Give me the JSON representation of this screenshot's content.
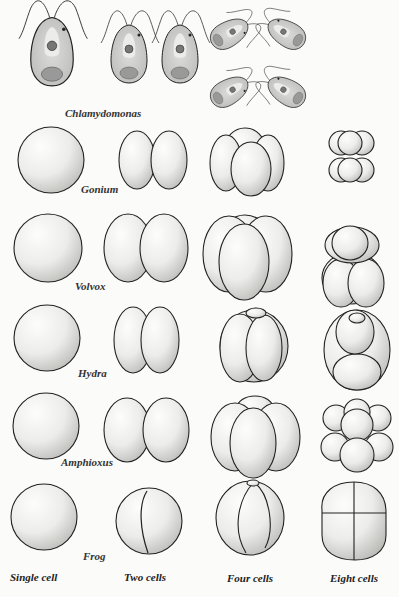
{
  "figure": {
    "top_organism": {
      "label": "Chlamydomonas",
      "stages": [
        "single cell with flagella",
        "two daughter cells",
        "four daughter cells"
      ]
    },
    "rows": [
      {
        "label": "Gonium",
        "stages": [
          "Single cell",
          "Two cells",
          "Four cells",
          "Eight cells"
        ]
      },
      {
        "label": "Volvox",
        "stages": [
          "Single cell",
          "Two cells",
          "Four cells",
          "Eight cells"
        ]
      },
      {
        "label": "Hydra",
        "stages": [
          "Single cell",
          "Two cells",
          "Four cells",
          "Eight cells"
        ]
      },
      {
        "label": "Amphioxus",
        "stages": [
          "Single cell",
          "Two cells",
          "Four cells",
          "Eight cells"
        ]
      },
      {
        "label": "Frog",
        "stages": [
          "Single cell",
          "Two cells",
          "Four cells",
          "Eight cells"
        ]
      }
    ],
    "column_captions": [
      "Single cell",
      "Two cells",
      "Four cells",
      "Eight cells"
    ],
    "colors": {
      "background": "#fbfbf9",
      "ink": "#222222",
      "stipple": "#8a8a8a",
      "cell_fill": "#ededeb"
    }
  }
}
